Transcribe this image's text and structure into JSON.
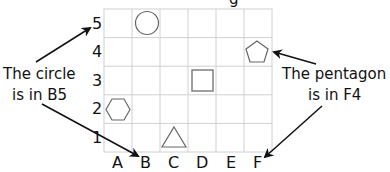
{
  "title_partial": "g",
  "grid": {
    "columns": [
      "A",
      "B",
      "C",
      "D",
      "E",
      "F"
    ],
    "rows": [
      "1",
      "2",
      "3",
      "4",
      "5"
    ],
    "line_color": "#d0d0d0"
  },
  "shapes": [
    {
      "shape": "circle",
      "cell": "B5"
    },
    {
      "shape": "pentagon",
      "cell": "F4"
    },
    {
      "shape": "square",
      "cell": "D3"
    },
    {
      "shape": "hexagon",
      "cell": "A2"
    },
    {
      "shape": "triangle",
      "cell": "C1"
    }
  ],
  "annotations": {
    "left": {
      "line1": "The circle",
      "line2": "is in B5"
    },
    "right": {
      "line1": "The pentagon",
      "line2": "is in F4"
    }
  }
}
